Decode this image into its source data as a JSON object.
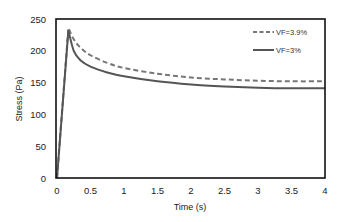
{
  "chart_data": {
    "type": "line",
    "title": "",
    "xlabel": "Time (s)",
    "ylabel": "Stress (Pa)",
    "xlim": [
      0,
      4
    ],
    "ylim": [
      0,
      250
    ],
    "xticks": [
      "0",
      "0.5",
      "1",
      "1.5",
      "2",
      "2.5",
      "3",
      "3.5",
      "4"
    ],
    "yticks": [
      "0",
      "50",
      "100",
      "150",
      "200",
      "250"
    ],
    "grid": false,
    "legend_position": "upper right (inside)",
    "series": [
      {
        "name": "VF=3.9%",
        "style": "dashed",
        "color": "#777777",
        "x": [
          0,
          0.17,
          0.25,
          0.35,
          0.5,
          0.75,
          1.0,
          1.5,
          2.0,
          2.5,
          3.0,
          3.5,
          4.0
        ],
        "y": [
          0,
          236,
          218,
          205,
          193,
          181,
          173,
          164,
          158,
          155,
          153,
          152,
          152
        ]
      },
      {
        "name": "VF=3%",
        "style": "solid",
        "color": "#555555",
        "x": [
          0,
          0.17,
          0.25,
          0.35,
          0.5,
          0.75,
          1.0,
          1.5,
          2.0,
          2.5,
          3.0,
          3.5,
          4.0
        ],
        "y": [
          0,
          232,
          200,
          185,
          175,
          166,
          160,
          152,
          147,
          144,
          142,
          141,
          141
        ]
      }
    ]
  }
}
